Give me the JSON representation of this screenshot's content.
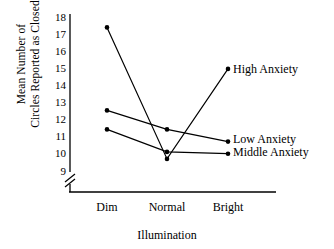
{
  "chart_data": {
    "type": "line",
    "title": "",
    "xlabel": "Illumination",
    "ylabel": "Mean Number of Circles Reported as Closed",
    "ylabel_lines": [
      "Mean Number of",
      "Circles Reported as Closed"
    ],
    "categories": [
      "Dim",
      "Normal",
      "Bright"
    ],
    "yticks": [
      18,
      17,
      16,
      15,
      14,
      13,
      12,
      11,
      10,
      9
    ],
    "ylim": [
      9,
      18
    ],
    "axis_break": true,
    "axis_break_symbol": "//",
    "grid": false,
    "legend_position": "inline-right",
    "series": [
      {
        "name": "High Anxiety",
        "values": [
          17.4,
          9.8,
          15.0
        ],
        "color": "#000000",
        "marker": "dot",
        "label": "High Anxiety"
      },
      {
        "name": "Low Anxiety",
        "values": [
          12.6,
          11.5,
          10.8
        ],
        "color": "#000000",
        "marker": "dot",
        "label": "Low Anxiety"
      },
      {
        "name": "Middle Anxiety",
        "values": [
          11.5,
          10.2,
          10.1
        ],
        "color": "#000000",
        "marker": "dot",
        "label": "Middle Anxiety"
      }
    ]
  },
  "axes": {
    "y_tick_labels": [
      "18",
      "17",
      "16",
      "15",
      "14",
      "13",
      "12",
      "11",
      "10",
      "9"
    ],
    "x_tick_labels": [
      "Dim",
      "Normal",
      "Bright"
    ],
    "x_axis_title": "Illumination",
    "y_axis_title_line1": "Mean Number of",
    "y_axis_title_line2": "Circles Reported as Closed"
  },
  "annotations": {
    "high": "High Anxiety",
    "low": "Low Anxiety",
    "middle": "Middle Anxiety"
  },
  "colors": {
    "background": "#ffffff",
    "ink": "#000000"
  }
}
